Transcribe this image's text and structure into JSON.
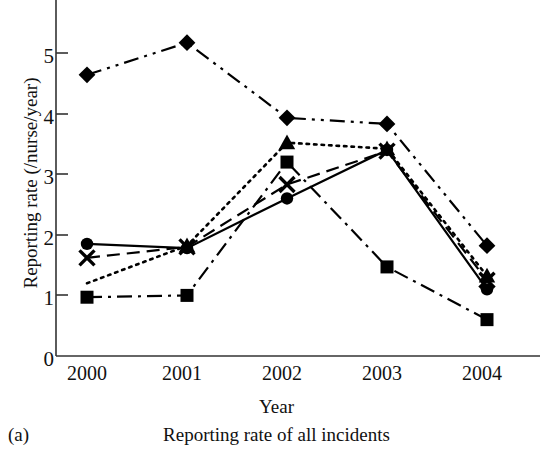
{
  "chart_data": {
    "type": "line",
    "title": "",
    "xlabel": "Year",
    "ylabel": "Reporting rate (/nurse/year)",
    "caption": "Reporting rate of all incidents",
    "panel_label": "(a)",
    "categories": [
      "2000",
      "2001",
      "2002",
      "2003",
      "2004"
    ],
    "ylim": [
      0,
      5.6
    ],
    "yticks": [
      "0",
      "1",
      "2",
      "3",
      "4",
      "5"
    ],
    "ytick_values": [
      0,
      1,
      2,
      3,
      4,
      5
    ],
    "grid": false,
    "legend": "none",
    "series": [
      {
        "name": "series-diamond",
        "marker": "diamond",
        "linestyle": "dash-dot-dot",
        "color": "#000000",
        "values": [
          4.64,
          5.17,
          3.93,
          3.83,
          1.82
        ]
      },
      {
        "name": "series-triangle",
        "marker": "triangle",
        "linestyle": "dotted",
        "color": "#000000",
        "values": [
          1.2,
          1.82,
          3.52,
          3.42,
          1.32
        ]
      },
      {
        "name": "series-square",
        "marker": "square",
        "linestyle": "dash-dot",
        "color": "#000000",
        "values": [
          0.97,
          1.0,
          3.2,
          1.47,
          0.6
        ]
      },
      {
        "name": "series-cross",
        "marker": "x",
        "linestyle": "dashed",
        "color": "#000000",
        "values": [
          1.62,
          1.8,
          2.83,
          3.38,
          1.25
        ]
      },
      {
        "name": "series-circle",
        "marker": "circle",
        "linestyle": "solid",
        "color": "#000000",
        "values": [
          1.85,
          1.78,
          2.6,
          3.4,
          1.1
        ]
      }
    ]
  }
}
